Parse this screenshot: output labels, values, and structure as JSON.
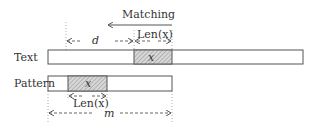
{
  "diagram": {
    "title": "Matching",
    "rows": [
      {
        "label": "Text",
        "matched_segment": "x"
      },
      {
        "label": "Pattern",
        "matched_segment": "x"
      }
    ],
    "annotations": {
      "d": "d",
      "len_top": "Len(x)",
      "len_bottom": "Len(x)",
      "m": "m"
    },
    "colors": {
      "stroke": "#555555",
      "hatch": "#bdbdbd",
      "dashed": "#666666"
    }
  }
}
